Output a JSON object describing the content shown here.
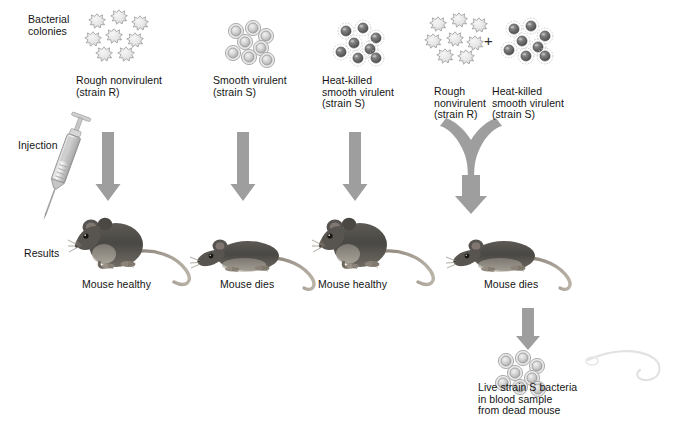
{
  "figure": {
    "background_color": "#ffffff",
    "arrow_color": "#9a9a9a",
    "text_color": "#141414"
  },
  "row_labels": [
    {
      "id": "bacterial-colonies",
      "text": "Bacterial\ncolonies",
      "x": 28,
      "y": 14
    },
    {
      "id": "injection",
      "text": "Injection",
      "x": 18,
      "y": 140
    },
    {
      "id": "results",
      "text": "Results",
      "x": 24,
      "y": 248
    }
  ],
  "columns": [
    {
      "id": "column-1",
      "colony_type": "rough",
      "colony_label": "Rough nonvirulent\n(strain R)",
      "colony_label_x": 76,
      "colony_label_y": 75,
      "colonies_x": 86,
      "colonies_y": 10,
      "arrow": {
        "type": "straight",
        "x": 108,
        "y": 128,
        "height": 78
      },
      "mouse_state": "healthy",
      "mouse_x": 74,
      "mouse_y": 212,
      "result_label": "Mouse healthy",
      "result_label_x": 82,
      "result_label_y": 279
    },
    {
      "id": "column-2",
      "colony_type": "smooth",
      "colony_label": "Smooth virulent\n(strain S)",
      "colony_label_x": 213,
      "colony_label_y": 75,
      "colonies_x": 224,
      "colonies_y": 20,
      "arrow": {
        "type": "straight",
        "x": 243,
        "y": 128,
        "height": 78
      },
      "mouse_state": "dead",
      "mouse_x": 198,
      "mouse_y": 228,
      "result_label": "Mouse dies",
      "result_label_x": 220,
      "result_label_y": 279
    },
    {
      "id": "column-3",
      "colony_type": "heat-killed",
      "colony_label": "Heat-killed\nsmooth virulent\n(strain S)",
      "colony_label_x": 322,
      "colony_label_y": 75,
      "colonies_x": 332,
      "colonies_y": 20,
      "arrow": {
        "type": "straight",
        "x": 355,
        "y": 128,
        "height": 78
      },
      "mouse_state": "healthy",
      "mouse_x": 320,
      "mouse_y": 212,
      "result_label": "Mouse healthy",
      "result_label_x": 318,
      "result_label_y": 279
    },
    {
      "id": "column-4",
      "colony_type": "mixed",
      "colony_label_left": "Rough\nnonvirulent\n(strain R)",
      "colony_label_left_x": 434,
      "colony_label_left_y": 86,
      "colony_label_right": "Heat-killed\nsmooth virulent\n(strain S)",
      "colony_label_right_x": 492,
      "colony_label_right_y": 86,
      "plus_sign": "+",
      "plus_x": 484,
      "plus_y": 38,
      "rough_colonies_x": 428,
      "rough_colonies_y": 14,
      "smooth_colonies_x": 500,
      "smooth_colonies_y": 22,
      "arrow": {
        "type": "merge",
        "x": 468,
        "y": 130
      },
      "mouse_state": "dead",
      "mouse_x": 455,
      "mouse_y": 228,
      "result_label": "Mouse dies",
      "result_label_x": 484,
      "result_label_y": 279
    }
  ],
  "followup": {
    "arrow": {
      "type": "straight",
      "x": 528,
      "y": 310,
      "height": 36
    },
    "colonies_x": 494,
    "colonies_y": 352,
    "label": "Live strain S bacteria\nin blood sample\nfrom dead mouse",
    "label_x": 478,
    "label_y": 382
  },
  "syringe": {
    "id": "syringe",
    "x": 48,
    "y": 110,
    "rotation_deg": 22
  },
  "stray_tail": {
    "id": "stray-mouse-tail",
    "x": 590,
    "y": 352
  }
}
